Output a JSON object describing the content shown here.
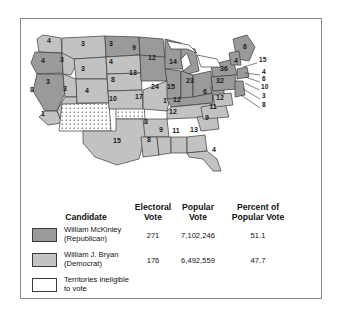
{
  "figure": {
    "type": "choropleth-map-with-table"
  },
  "map": {
    "colors": {
      "mckinley": "#9a9a9a",
      "bryan": "#c2c2c2",
      "territory": "#ffffff",
      "outline": "#3a3a3a"
    },
    "state_labels": [
      {
        "state": "Washington",
        "value": "4",
        "party": "bryan",
        "x": 28,
        "y": 24
      },
      {
        "state": "Oregon",
        "value": "4",
        "party": "mckinley",
        "x": 22,
        "y": 44
      },
      {
        "state": "Idaho",
        "value": "3",
        "party": "bryan",
        "x": 41,
        "y": 43
      },
      {
        "state": "Montana",
        "value": "3",
        "party": "bryan",
        "x": 62,
        "y": 27
      },
      {
        "state": "Wyoming",
        "value": "3",
        "party": "bryan",
        "x": 62,
        "y": 52
      },
      {
        "state": "Nevada",
        "value": "3",
        "party": "bryan",
        "x": 27,
        "y": 65
      },
      {
        "state": "California",
        "value": "8",
        "party": "mckinley",
        "x": 11,
        "y": 73
      },
      {
        "state": "California-south",
        "value": "1",
        "party": "bryan",
        "x": 22,
        "y": 97
      },
      {
        "state": "Utah",
        "value": "3",
        "party": "bryan",
        "x": 44,
        "y": 72
      },
      {
        "state": "Colorado",
        "value": "4",
        "party": "bryan",
        "x": 66,
        "y": 74
      },
      {
        "state": "North Dakota",
        "value": "3",
        "party": "mckinley",
        "x": 90,
        "y": 27
      },
      {
        "state": "South Dakota",
        "value": "4",
        "party": "bryan",
        "x": 90,
        "y": 45
      },
      {
        "state": "Nebraska",
        "value": "8",
        "party": "bryan",
        "x": 92,
        "y": 63
      },
      {
        "state": "Kansas",
        "value": "10",
        "party": "bryan",
        "x": 92,
        "y": 82
      },
      {
        "state": "Minnesota",
        "value": "9",
        "party": "mckinley",
        "x": 113,
        "y": 31
      },
      {
        "state": "Iowa",
        "value": "13",
        "party": "mckinley",
        "x": 112,
        "y": 56
      },
      {
        "state": "Missouri",
        "value": "17",
        "party": "bryan",
        "x": 118,
        "y": 80
      },
      {
        "state": "Wisconsin",
        "value": "12",
        "party": "mckinley",
        "x": 131,
        "y": 41
      },
      {
        "state": "Michigan",
        "value": "14",
        "party": "mckinley",
        "x": 152,
        "y": 45
      },
      {
        "state": "Illinois",
        "value": "24",
        "party": "mckinley",
        "x": 134,
        "y": 70
      },
      {
        "state": "Indiana",
        "value": "15",
        "party": "mckinley",
        "x": 150,
        "y": 70
      },
      {
        "state": "Ohio",
        "value": "23",
        "party": "mckinley",
        "x": 169,
        "y": 64
      },
      {
        "state": "Kentucky",
        "value": "12",
        "party": "mckinley",
        "x": 156,
        "y": 83
      },
      {
        "state": "West Virginia",
        "value": "6",
        "party": "mckinley",
        "x": 184,
        "y": 75
      },
      {
        "state": "Tennessee",
        "value": "12",
        "party": "bryan",
        "x": 152,
        "y": 95
      },
      {
        "state": "Arkansas",
        "value": "8",
        "party": "bryan",
        "x": 125,
        "y": 105
      },
      {
        "state": "Texas",
        "value": "15",
        "party": "bryan",
        "x": 96,
        "y": 124
      },
      {
        "state": "Louisiana",
        "value": "8",
        "party": "bryan",
        "x": 128,
        "y": 123
      },
      {
        "state": "Mississippi",
        "value": "9",
        "party": "bryan",
        "x": 140,
        "y": 113
      },
      {
        "state": "Alabama",
        "value": "11",
        "party": "bryan",
        "x": 155,
        "y": 114
      },
      {
        "state": "Georgia",
        "value": "13",
        "party": "bryan",
        "x": 173,
        "y": 113
      },
      {
        "state": "Florida",
        "value": "4",
        "party": "bryan",
        "x": 193,
        "y": 133
      },
      {
        "state": "South Carolina",
        "value": "9",
        "party": "bryan",
        "x": 186,
        "y": 101
      },
      {
        "state": "North Carolina",
        "value": "11",
        "party": "bryan",
        "x": 192,
        "y": 90
      },
      {
        "state": "Virginia",
        "value": "12",
        "party": "bryan",
        "x": 199,
        "y": 81
      },
      {
        "state": "New York",
        "value": "36",
        "party": "mckinley",
        "x": 203,
        "y": 52
      },
      {
        "state": "Pennsylvania",
        "value": "32",
        "party": "mckinley",
        "x": 199,
        "y": 64
      },
      {
        "state": "Maine",
        "value": "6",
        "party": "mckinley",
        "x": 224,
        "y": 30
      },
      {
        "state": "New Hampshire",
        "value": "4",
        "party": "mckinley",
        "x": 215,
        "y": 44
      },
      {
        "state": "Missouri-small",
        "value": "1",
        "party": "bryan",
        "x": 144,
        "y": 84
      }
    ],
    "leader_labels": [
      {
        "state": "Vermont",
        "value": "15",
        "x": 238,
        "y": 43
      },
      {
        "state": "Massachusetts",
        "value": "4",
        "x": 241,
        "y": 55
      },
      {
        "state": "Rhode Island",
        "value": "6",
        "x": 241,
        "y": 62
      },
      {
        "state": "Connecticut",
        "value": "10",
        "x": 240,
        "y": 70
      },
      {
        "state": "New Jersey",
        "value": "3",
        "x": 241,
        "y": 79
      },
      {
        "state": "Delaware",
        "value": "8",
        "x": 241,
        "y": 88
      }
    ]
  },
  "table": {
    "headers": {
      "candidate": "Candidate",
      "electoral_vote": "Electoral\nVote",
      "electoral_vote_l1": "Electoral",
      "electoral_vote_l2": "Vote",
      "popular_vote_l1": "Popular",
      "popular_vote_l2": "Vote",
      "percent_l1": "Percent of",
      "percent_l2": "Popular Vote"
    },
    "rows": [
      {
        "swatch": "mckinley",
        "name_line1": "William McKinley",
        "name_line2": "(Republican)",
        "electoral_vote": "271",
        "popular_vote": "7,102,246",
        "percent": "51.1"
      },
      {
        "swatch": "bryan",
        "name_line1": "William J. Bryan",
        "name_line2": "(Democrat)",
        "electoral_vote": "176",
        "popular_vote": "6,492,559",
        "percent": "47.7"
      },
      {
        "swatch": "territory",
        "name_line1": "Territories ineligible",
        "name_line2": "to vote",
        "electoral_vote": "",
        "popular_vote": "",
        "percent": ""
      }
    ]
  }
}
